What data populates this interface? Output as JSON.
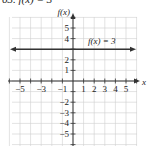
{
  "header": {
    "text": "63. f(x) = 3"
  },
  "chart_data": {
    "type": "line",
    "title": "",
    "xlabel": "x",
    "ylabel": "f(x)",
    "xlim": [
      -5.5,
      6
    ],
    "ylim": [
      -6,
      6
    ],
    "x_tick_labels": [
      "-5",
      "-3",
      "-1",
      "1",
      "2",
      "3",
      "4",
      "5"
    ],
    "y_tick_labels": [
      "5",
      "4",
      "2",
      "1",
      "-2",
      "-3",
      "-4",
      "-5"
    ],
    "grid": true,
    "series": [
      {
        "name": "f(x) = 3",
        "x": [
          -5.5,
          5.5
        ],
        "y": [
          3,
          3
        ],
        "arrows": "both"
      }
    ],
    "annotations": [
      {
        "text": "f(x) = 3",
        "x": 3,
        "y": 3.8
      }
    ]
  },
  "colors": {
    "grid": "#cfcfcf",
    "axis": "#333333",
    "line": "#333333"
  }
}
